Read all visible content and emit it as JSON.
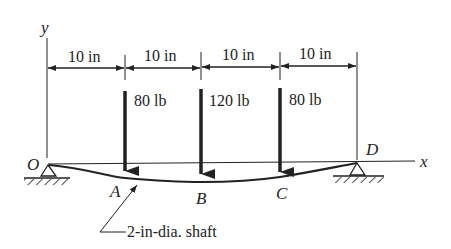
{
  "figure": {
    "axes": {
      "y_label": "y",
      "x_label": "x"
    },
    "points": [
      {
        "id": "O",
        "label": "O"
      },
      {
        "id": "A",
        "label": "A"
      },
      {
        "id": "B",
        "label": "B"
      },
      {
        "id": "C",
        "label": "C"
      },
      {
        "id": "D",
        "label": "D"
      }
    ],
    "dimensions": [
      {
        "label": "10 in"
      },
      {
        "label": "10 in"
      },
      {
        "label": "10 in"
      },
      {
        "label": "10 in"
      }
    ],
    "loads": [
      {
        "at": "A",
        "label": "80 lb"
      },
      {
        "at": "B",
        "label": "120 lb"
      },
      {
        "at": "C",
        "label": "80 lb"
      }
    ],
    "shaft_callout": "2-in-dia. shaft",
    "colors": {
      "ink": "#222222",
      "background": "#ffffff"
    }
  }
}
